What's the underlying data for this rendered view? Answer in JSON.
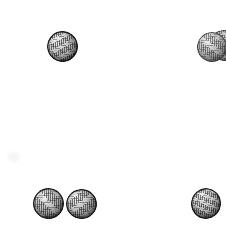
{
  "page": {
    "background_color": "#ffffff",
    "width": 226,
    "height": 240
  },
  "palette": {
    "paper": "#ffffff",
    "sphere_outline": "#141414",
    "sphere_midtone": "#b4b4b4",
    "sphere_shadow": "#5e5e5e",
    "sphere_highlight": "#ffffff",
    "smudge": "#f7f7f7"
  },
  "groups": [
    {
      "name": "top-left-group",
      "label": "Top left sphere",
      "count": 1
    },
    {
      "name": "top-right-group",
      "label": "Top right overlapping pair",
      "count": 2
    },
    {
      "name": "bottom-left-group",
      "label": "Bottom left adjacent pair",
      "count": 2
    },
    {
      "name": "bottom-right-group",
      "label": "Bottom right sphere",
      "count": 1
    }
  ],
  "spheres": [
    {
      "id": "sphere-1",
      "group": "top-left-group",
      "x": 47,
      "y": 31,
      "width": 31,
      "height": 31,
      "rotation": -6,
      "tone": "dark",
      "clipped": false,
      "z": 4
    },
    {
      "id": "sphere-2",
      "group": "top-right-group",
      "x": 197,
      "y": 32,
      "width": 30,
      "height": 30,
      "rotation": 4,
      "tone": "mid",
      "clipped": false,
      "z": 3
    },
    {
      "id": "sphere-3",
      "group": "top-right-group",
      "x": 209,
      "y": 30,
      "width": 30,
      "height": 31,
      "rotation": -10,
      "tone": "mid",
      "clipped": true,
      "z": 2
    },
    {
      "id": "sphere-4",
      "group": "bottom-left-group",
      "x": 33,
      "y": 188,
      "width": 31,
      "height": 31,
      "rotation": 3,
      "tone": "dark",
      "clipped": false,
      "z": 4
    },
    {
      "id": "sphere-5",
      "group": "bottom-left-group",
      "x": 66,
      "y": 189,
      "width": 31,
      "height": 30,
      "rotation": -4,
      "tone": "dark",
      "clipped": false,
      "z": 4
    },
    {
      "id": "sphere-6",
      "group": "bottom-right-group",
      "x": 191,
      "y": 188,
      "width": 30,
      "height": 31,
      "rotation": 8,
      "tone": "dark",
      "clipped": false,
      "z": 4
    }
  ],
  "artifacts": [
    {
      "id": "smudge-1",
      "label": "faint scanner smudge",
      "x": 8,
      "y": 152,
      "width": 12,
      "height": 10
    }
  ]
}
